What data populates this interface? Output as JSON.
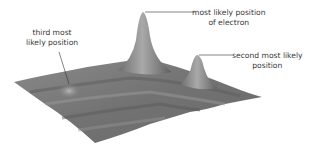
{
  "figure": {
    "labels": {
      "primary_line1": "most likely position",
      "primary_line2": "of electron",
      "secondary_line1": "second most likely",
      "secondary_line2": "position",
      "tertiary_line1": "third most",
      "tertiary_line2": "likely position"
    },
    "colors": {
      "surface": "#7a7a7a",
      "surface_dark": "#555555",
      "surface_light": "#b5b5b5",
      "leader_line": "#333333",
      "text": "#3a3a3a",
      "background": "#ffffff"
    }
  }
}
